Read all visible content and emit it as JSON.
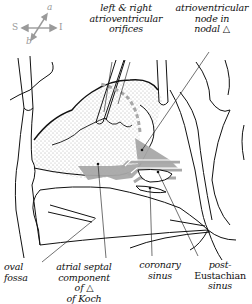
{
  "figure": {
    "colors": {
      "line": "#111111",
      "triangle_fill": "#a8a8a8",
      "compass": "#9a9a9a",
      "stipple": "#555555"
    }
  },
  "compass": {
    "top": "a",
    "left": "S",
    "right": "I",
    "bottom": "b"
  },
  "labels": {
    "av_orifices": {
      "lines": [
        "left & right",
        "atrioventricular",
        "orifices"
      ]
    },
    "av_node": {
      "lines": [
        "atrioventricular",
        "node in",
        "nodal △"
      ]
    },
    "oval_fossa": {
      "lines": [
        "oval",
        "fossa"
      ]
    },
    "atrial_septal": {
      "lines": [
        "atrial septal",
        "component",
        "of △",
        "of Koch"
      ]
    },
    "coronary_sinus": {
      "lines": [
        "coronary",
        "sinus"
      ]
    },
    "post_eustachian": {
      "lines": [
        "post-",
        "Eustachian",
        "sinus"
      ]
    }
  }
}
